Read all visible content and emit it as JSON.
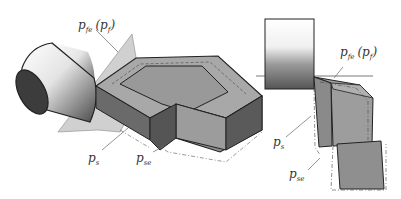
{
  "figure": {
    "left_view": {
      "labels": {
        "fe_main": "p",
        "fe_sub": "fe",
        "f_paren_open": "(",
        "f_main": "p",
        "f_sub": "f",
        "f_paren_close": ")",
        "s_main": "p",
        "s_sub": "s",
        "se_main": "p",
        "se_sub": "se"
      }
    },
    "right_view": {
      "labels": {
        "fe_main": "p",
        "fe_sub": "fe",
        "f_paren_open": "(",
        "f_main": "p",
        "f_sub": "f",
        "f_paren_close": ")",
        "s_main": "p",
        "s_sub": "s",
        "se_main": "p",
        "se_sub": "se"
      }
    },
    "colors": {
      "tool_face": "#9a9a9a",
      "tool_dark": "#5e5e5e",
      "tool_light": "#b4b4b4",
      "plane": "#c8c8c8",
      "outline": "#222222"
    }
  }
}
